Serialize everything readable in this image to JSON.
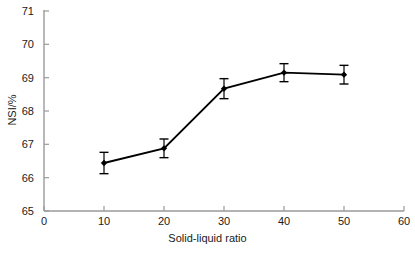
{
  "chart_data": {
    "type": "line",
    "title": "",
    "xlabel": "Solid-liquid ratio",
    "ylabel": "NSI/%",
    "x": [
      10,
      20,
      30,
      40,
      50
    ],
    "values": [
      66.44,
      66.88,
      68.67,
      69.15,
      69.09
    ],
    "errors": [
      0.32,
      0.28,
      0.3,
      0.27,
      0.28
    ],
    "xlim": [
      0,
      60
    ],
    "ylim": [
      65,
      71
    ],
    "xticks": [
      0,
      10,
      20,
      30,
      40,
      50,
      60
    ],
    "yticks": [
      65,
      66,
      67,
      68,
      69,
      70,
      71
    ],
    "xtick_labels": [
      "0",
      "10",
      "20",
      "30",
      "40",
      "50",
      "60"
    ],
    "ytick_labels": [
      "65",
      "66",
      "67",
      "68",
      "69",
      "70",
      "71"
    ],
    "grid": false,
    "legend": null,
    "series": [
      {
        "name": "NSI",
        "values": [
          66.44,
          66.88,
          68.67,
          69.15,
          69.09
        ],
        "marker": "filled-diamond",
        "line_color": "#000000",
        "marker_color": "#000000",
        "error_bars": true
      }
    ],
    "axis_color": "#808080",
    "text_color": "#1a1a1a",
    "background": "#ffffff"
  }
}
